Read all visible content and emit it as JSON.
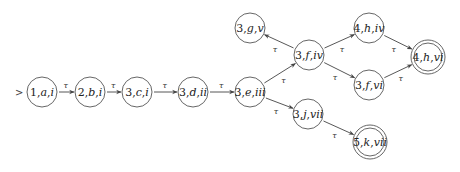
{
  "diagram": {
    "type": "state-transition-graph",
    "start_node": "n1",
    "nodes": [
      {
        "id": "n1",
        "label": "1,a,i",
        "x": 42,
        "y": 92,
        "accepting": false
      },
      {
        "id": "n2",
        "label": "2,b,i",
        "x": 90,
        "y": 92,
        "accepting": false
      },
      {
        "id": "n3",
        "label": "3,c,i",
        "x": 137,
        "y": 92,
        "accepting": false
      },
      {
        "id": "n4",
        "label": "3,d,ii",
        "x": 193,
        "y": 92,
        "accepting": false
      },
      {
        "id": "n5",
        "label": "3,e,iii",
        "x": 250,
        "y": 92,
        "accepting": false
      },
      {
        "id": "n6",
        "label": "3,g,v",
        "x": 250,
        "y": 28,
        "accepting": false
      },
      {
        "id": "n7",
        "label": "3,f,iv",
        "x": 309,
        "y": 55,
        "accepting": false
      },
      {
        "id": "n8",
        "label": "4,h,iv",
        "x": 369,
        "y": 28,
        "accepting": false
      },
      {
        "id": "n9",
        "label": "3,f,vi",
        "x": 369,
        "y": 85,
        "accepting": false
      },
      {
        "id": "n10",
        "label": "4,h,vi",
        "x": 428,
        "y": 57,
        "accepting": true
      },
      {
        "id": "n11",
        "label": "3,j,vii",
        "x": 308,
        "y": 114,
        "accepting": false
      },
      {
        "id": "n12",
        "label": "5,k,vii",
        "x": 370,
        "y": 142,
        "accepting": true
      }
    ],
    "edges": [
      {
        "from": "n1",
        "to": "n2",
        "label": "τ"
      },
      {
        "from": "n2",
        "to": "n3",
        "label": "τ"
      },
      {
        "from": "n3",
        "to": "n4",
        "label": "τ"
      },
      {
        "from": "n4",
        "to": "n5",
        "label": "τ"
      },
      {
        "from": "n5",
        "to": "n7",
        "label": "τ"
      },
      {
        "from": "n7",
        "to": "n6",
        "label": "τ"
      },
      {
        "from": "n7",
        "to": "n8",
        "label": "τ"
      },
      {
        "from": "n7",
        "to": "n9",
        "label": "τ"
      },
      {
        "from": "n8",
        "to": "n10",
        "label": "τ"
      },
      {
        "from": "n9",
        "to": "n10",
        "label": "τ"
      },
      {
        "from": "n5",
        "to": "n11",
        "label": "τ"
      },
      {
        "from": "n11",
        "to": "n12",
        "label": "τ"
      }
    ],
    "start_marker": ">"
  }
}
